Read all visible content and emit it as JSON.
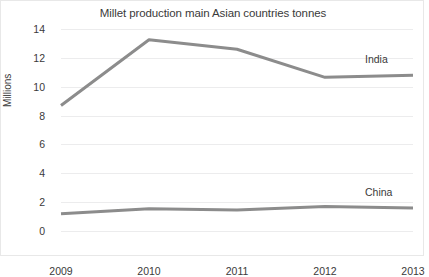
{
  "chart_data": {
    "type": "line",
    "title": "Millet production main Asian countries tonnes",
    "xlabel": "",
    "ylabel": "Millions",
    "categories": [
      "2009",
      "2010",
      "2011",
      "2012",
      "2013"
    ],
    "series": [
      {
        "name": "India",
        "color": "#8c8c8c",
        "values": [
          8.7,
          13.25,
          12.6,
          10.65,
          10.8
        ]
      },
      {
        "name": "China",
        "color": "#8c8c8c",
        "values": [
          1.2,
          1.55,
          1.45,
          1.7,
          1.6
        ]
      }
    ],
    "ylim": [
      0,
      14
    ],
    "yticks": [
      0,
      2,
      4,
      6,
      8,
      10,
      12,
      14
    ],
    "ytick_labels": [
      "0",
      "2",
      "4",
      "6",
      "8",
      "10",
      "12",
      "14"
    ],
    "grid": true,
    "legend_position": "inline-right",
    "annotations": [
      {
        "text": "India",
        "series": "India"
      },
      {
        "text": "China",
        "series": "China"
      }
    ]
  },
  "colors": {
    "line": "#8c8c8c",
    "grid": "#ececed",
    "text": "#3a3a3a",
    "border": "#e8e8e8",
    "background": "#ffffff"
  }
}
